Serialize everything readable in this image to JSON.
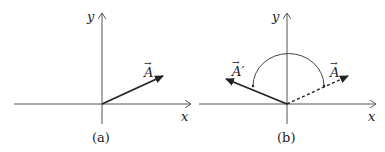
{
  "panels": [
    {
      "caption": "(a)",
      "x_label": "x",
      "y_label": "y",
      "vectors": [
        {
          "label": "A",
          "style": "solid",
          "arrow_symbol": "→"
        }
      ]
    },
    {
      "caption": "(b)",
      "x_label": "x",
      "y_label": "y",
      "vectors": [
        {
          "label": "A′",
          "style": "solid",
          "arrow_symbol": "→"
        },
        {
          "label": "A",
          "style": "dashed",
          "arrow_symbol": "→"
        }
      ],
      "rotation_arc": "semicircular arc indicating rotation from A to A′"
    }
  ],
  "colors": {
    "axis": "#555555",
    "vector": "#222222",
    "background": "#ffffff"
  }
}
